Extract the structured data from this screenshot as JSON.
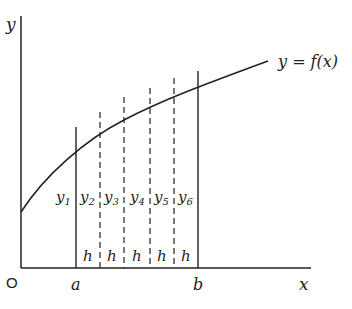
{
  "diagram": {
    "type": "trapezoidal-rule-area-under-curve",
    "curve_label": "y = f(x)",
    "axes": {
      "x_label": "x",
      "y_label": "y",
      "origin_label": "O"
    },
    "x_ticks": {
      "a": "a",
      "b": "b"
    },
    "ordinates": [
      "y1",
      "y2",
      "y3",
      "y4",
      "y5",
      "y6"
    ],
    "ordinate_labels": [
      {
        "base": "y",
        "sub": "1"
      },
      {
        "base": "y",
        "sub": "2"
      },
      {
        "base": "y",
        "sub": "3"
      },
      {
        "base": "y",
        "sub": "4"
      },
      {
        "base": "y",
        "sub": "5"
      },
      {
        "base": "y",
        "sub": "6"
      }
    ],
    "strip_width_label": "h",
    "strip_count": 5,
    "colors": {
      "ink": "#222222",
      "background": "#ffffff"
    }
  }
}
